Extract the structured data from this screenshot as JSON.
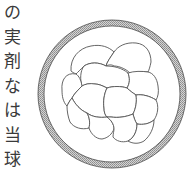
{
  "text_column": {
    "chars": [
      "の",
      "実",
      "剤",
      "な",
      "は",
      "当",
      "球"
    ]
  },
  "diagram": {
    "ring": {
      "cx": 112,
      "cy": 94,
      "outer_r": 74,
      "inner_r": 68,
      "fill": "#b8b8b8",
      "stroke": "#4a4a4a"
    },
    "cell_stroke": "#555555",
    "cells": [
      "M71,71 C70,58 79,48 91,46 C101,44 109,47 114,52 C110,58 107,62 106,66 C99,62 90,62 84,66 C80,70 78,72 76,74 C74,73 72,72 71,71 Z",
      "M114,52 C118,46 126,42 136,43 C146,44 151,52 151,62 C150,67 149,70 148,72 C142,71 136,72 132,75 C128,70 120,66 114,66 C111,64 108,65 106,66 C107,62 110,58 114,52 Z",
      "M84,66 C90,62 99,62 106,66 C114,66 122,68 128,73 C130,78 130,83 127,88 C121,86 113,86 107,88 C103,86 99,84 95,84 C90,83 85,84 82,86 C80,80 80,71 84,66 Z",
      "M128,73 C134,71 142,71 148,72 C153,73 157,78 158,86 C159,92 158,97 156,100 C150,96 142,94 136,95 C133,93 130,91 127,88 C130,83 130,78 128,73 Z",
      "M62,90 C61,80 66,72 76,74 C79,76 81,80 82,86 C78,90 74,94 72,98 C70,100 68,104 67,106 C63,102 62,96 62,90 Z",
      "M82,86 C85,84 90,83 95,84 C99,84 103,86 107,88 C104,94 103,102 104,108 C104,112 105,115 107,117 C100,118 92,117 87,113 C80,110 75,104 72,98 C74,94 78,90 82,86 Z",
      "M107,88 C113,86 121,86 127,88 C130,91 133,93 136,95 C137,101 136,108 133,114 C126,117 118,118 111,117 C109,117 108,117 107,117 C105,115 104,112 104,108 C103,102 104,94 107,88 Z",
      "M136,95 C142,94 150,96 156,100 C159,106 158,114 154,120 C149,124 143,125 137,124 C135,121 134,118 133,114 C136,108 137,101 136,95 Z",
      "M67,106 C68,104 70,100 72,98 C75,104 80,110 87,113 C90,118 90,124 89,128 C82,130 74,128 70,122 C68,117 67,111 67,106 Z",
      "M87,113 C92,117 100,118 107,117 C111,120 114,124 114,129 C112,134 108,138 102,139 C96,139 91,134 89,128 C90,124 90,118 87,113 Z",
      "M107,117 C108,117 109,117 111,117 C118,118 126,117 133,114 C134,118 135,121 137,124 C137,131 134,138 128,141 C122,143 116,141 113,137 C113,134 114,131 114,129 C114,124 111,120 107,117 Z",
      "M137,124 C143,125 149,124 154,120 C154,128 150,136 144,141 C139,144 133,144 128,141 C134,138 137,131 137,124 Z"
    ]
  }
}
